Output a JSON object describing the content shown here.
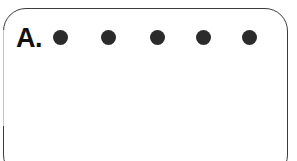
{
  "figure": {
    "background_color": "#ffffff",
    "width": 297,
    "height": 161
  },
  "panel": {
    "label": "A.",
    "label_color": "#111111",
    "border_color": "#3b3b3b",
    "border_width_px": 1.6,
    "corner_radius_px": 23,
    "fill_color": "#ffffff",
    "bottom_edge_clipped": true
  },
  "dot_row": {
    "count": 5,
    "diameter_px": 15,
    "color": "#2b2b2b",
    "center_y_px": 37,
    "dots": [
      {
        "name": "dot-1",
        "center_x_px": 60,
        "left_px": 53
      },
      {
        "name": "dot-2",
        "center_x_px": 108,
        "left_px": 101
      },
      {
        "name": "dot-3",
        "center_x_px": 157,
        "left_px": 150
      },
      {
        "name": "dot-4",
        "center_x_px": 203,
        "left_px": 196
      },
      {
        "name": "dot-5",
        "center_x_px": 249,
        "left_px": 242
      }
    ]
  }
}
